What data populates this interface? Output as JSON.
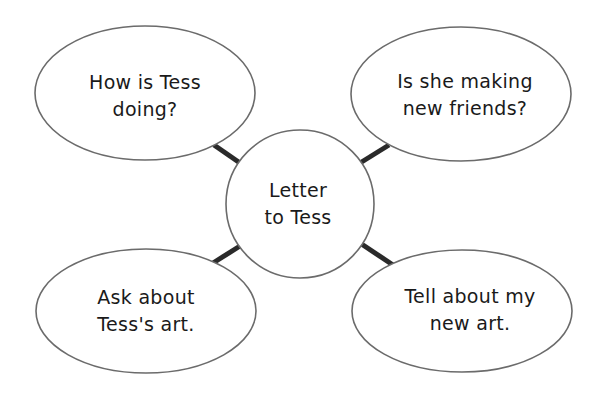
{
  "diagram": {
    "type": "idea web",
    "colors": {
      "background": "#ffffff",
      "outline": "#6b6b6b",
      "connector": "#2a2a2a",
      "text": "#1a1a1a"
    },
    "center": {
      "lines": [
        "Letter",
        "to Tess"
      ]
    },
    "nodes": [
      {
        "position": "top-left",
        "lines": [
          "How is Tess",
          "doing?"
        ]
      },
      {
        "position": "top-right",
        "lines": [
          "Is she making",
          "new friends?"
        ]
      },
      {
        "position": "bottom-left",
        "lines": [
          "Ask about",
          "Tess's art."
        ]
      },
      {
        "position": "bottom-right",
        "lines": [
          "Tell about my",
          "new art."
        ]
      }
    ]
  }
}
